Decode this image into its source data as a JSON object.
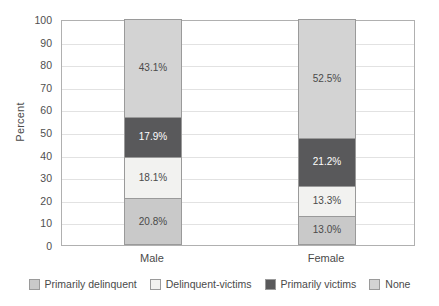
{
  "chart_data": {
    "type": "bar",
    "subtype": "stacked-percent",
    "title": "",
    "xlabel": "",
    "ylabel": "Percent",
    "ylim": [
      0,
      100
    ],
    "ytick_step": 10,
    "yticks": [
      100,
      90,
      80,
      70,
      60,
      50,
      40,
      30,
      20,
      10,
      0
    ],
    "grid": true,
    "grid_axis": "y",
    "legend_position": "bottom",
    "categories": [
      "Male",
      "Female"
    ],
    "series": [
      {
        "name": "Primarily delinquent",
        "color": "#c9c9c9",
        "values": [
          20.8,
          13.0
        ],
        "labels": [
          "20.8%",
          "13.0%"
        ]
      },
      {
        "name": "Delinquent-victims",
        "color": "#f2f2f0",
        "values": [
          18.1,
          13.3
        ],
        "labels": [
          "18.1%",
          "13.3%"
        ]
      },
      {
        "name": "Primarily victims",
        "color": "#59595b",
        "values": [
          17.9,
          21.2
        ],
        "labels": [
          "17.9%",
          "21.2%"
        ]
      },
      {
        "name": "None",
        "color": "#d3d3d3",
        "values": [
          43.1,
          52.5
        ],
        "labels": [
          "43.1%",
          "52.5%"
        ]
      }
    ]
  },
  "legend": {
    "entries": [
      {
        "label": "Primarily delinquent",
        "color": "#c9c9c9"
      },
      {
        "label": "Delinquent-victims",
        "color": "#f2f2f0"
      },
      {
        "label": "Primarily victims",
        "color": "#59595b"
      },
      {
        "label": "None",
        "color": "#d3d3d3"
      }
    ]
  },
  "axis": {
    "y_title": "Percent",
    "y_ticks": [
      "100",
      "90",
      "80",
      "70",
      "60",
      "50",
      "40",
      "30",
      "20",
      "10",
      "0"
    ],
    "x_ticks": [
      "Male",
      "Female"
    ]
  }
}
